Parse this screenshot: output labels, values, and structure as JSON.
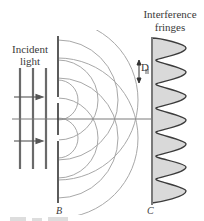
{
  "labels": {
    "incident_line1": "Incident",
    "incident_line2": "light",
    "fringes_line1": "Interference",
    "fringes_line2": "fringes",
    "spacing": "D",
    "barrier": "B",
    "screen": "C"
  },
  "colors": {
    "line": "#6a6a6a",
    "barrier": "#333333",
    "wave": "#a8a8a8",
    "fringe_fill": "#d9d9d9",
    "fringe_stroke": "#3c3c3c",
    "axis": "#7a7a7a"
  },
  "geometry": {
    "axis_y": 119,
    "barrier_x": 58,
    "slits_y": [
      100,
      138
    ],
    "screen_x": 152,
    "fringe_peaks_y": [
      48,
      72,
      96,
      120,
      144,
      167,
      191
    ],
    "incident_lines_x": [
      20,
      33,
      46
    ],
    "wave_radii": [
      20,
      40,
      60,
      80
    ]
  }
}
